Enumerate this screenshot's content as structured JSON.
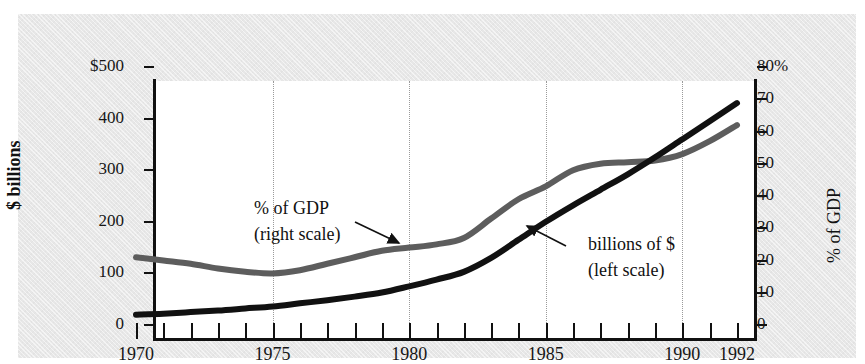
{
  "figure": {
    "top_ghost_text": "",
    "background_color": "#e7e7e7",
    "plot_background": "#ffffff"
  },
  "axes": {
    "left_title": "$ billions",
    "right_title": "% of GDP",
    "left_ticks": [
      "$500",
      "400",
      "300",
      "200",
      "100",
      "0"
    ],
    "left_values": [
      500,
      400,
      300,
      200,
      100,
      0
    ],
    "right_ticks": [
      "80%",
      "70",
      "60",
      "50",
      "40",
      "30",
      "20",
      "10",
      "0"
    ],
    "right_values": [
      80,
      70,
      60,
      50,
      40,
      30,
      20,
      10,
      0
    ],
    "x_ticks": [
      "1970",
      "1975",
      "1980",
      "1985",
      "1990",
      "1992"
    ],
    "x_tick_values": [
      1970,
      1975,
      1980,
      1985,
      1990,
      1992
    ],
    "gridline_years": [
      1975,
      1980,
      1985,
      1990
    ]
  },
  "annotations": {
    "gdp_line1": "% of GDP",
    "gdp_line2": "(right scale)",
    "dollars_line1": "billions of $",
    "dollars_line2": "(left scale)"
  },
  "colors": {
    "dollars_series": "#111111",
    "gdp_series": "#5d5d5d",
    "grid": "#9a9a9a",
    "axis": "#111111"
  },
  "chart_data": {
    "type": "line",
    "title": "",
    "subtitle": "",
    "xlabel": "",
    "ylabel": "$ billions",
    "y2label": "% of GDP",
    "xlim": [
      1970,
      1992
    ],
    "ylim": [
      0,
      500
    ],
    "y2lim": [
      0,
      80
    ],
    "grid": true,
    "legend": "annotations on plot",
    "x": [
      1970,
      1971,
      1972,
      1973,
      1974,
      1975,
      1976,
      1977,
      1978,
      1979,
      1980,
      1981,
      1982,
      1983,
      1984,
      1985,
      1986,
      1987,
      1988,
      1989,
      1990,
      1991,
      1992
    ],
    "series": [
      {
        "name": "billions of $ (left scale)",
        "axis": "left",
        "color": "#111111",
        "units": "$ billions",
        "values": [
          20,
          22,
          25,
          28,
          32,
          36,
          42,
          48,
          55,
          63,
          75,
          88,
          103,
          130,
          165,
          200,
          232,
          262,
          292,
          325,
          360,
          395,
          430
        ]
      },
      {
        "name": "% of GDP (right scale)",
        "axis": "right",
        "color": "#5d5d5d",
        "units": "percent of GDP",
        "values": [
          21,
          20,
          19,
          17.5,
          16.5,
          16,
          17,
          19,
          21,
          23,
          24,
          25,
          27,
          33,
          39,
          43,
          48,
          50,
          50.5,
          51,
          53,
          57,
          62
        ]
      }
    ]
  }
}
